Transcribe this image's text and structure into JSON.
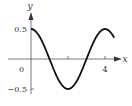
{
  "chart_data": {
    "type": "line",
    "title": "",
    "xlabel": "x",
    "ylabel": "y",
    "function": "y = 0.5 cos(pi x / 2)",
    "xlim": [
      0,
      4.5
    ],
    "ylim": [
      -0.5,
      0.5
    ],
    "x_ticks": [
      {
        "value": 2,
        "label": ""
      },
      {
        "value": 4,
        "label": "4"
      }
    ],
    "y_ticks": [
      {
        "value": 0.5,
        "label": "0.5"
      },
      {
        "value": -0.5,
        "label": "-0.5"
      }
    ],
    "origin_label": "0",
    "grid": false,
    "legend": null,
    "series": [
      {
        "name": "curve",
        "x": [
          0,
          0.25,
          0.5,
          0.75,
          1,
          1.25,
          1.5,
          1.75,
          2,
          2.25,
          2.5,
          2.75,
          3,
          3.25,
          3.5,
          3.75,
          4,
          4.25,
          4.5
        ],
        "values": [
          0.5,
          0.462,
          0.354,
          0.191,
          0,
          -0.191,
          -0.354,
          -0.462,
          -0.5,
          -0.462,
          -0.354,
          -0.191,
          0,
          0.191,
          0.354,
          0.462,
          0.5,
          0.462,
          0.354
        ]
      }
    ],
    "colors": {
      "curve": "#111111",
      "axes": "#555555",
      "text": "#333333"
    }
  }
}
